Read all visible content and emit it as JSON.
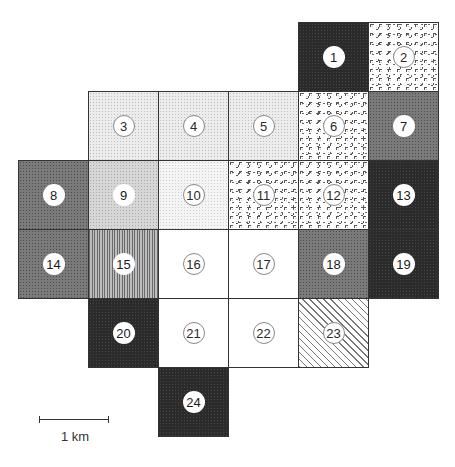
{
  "diagram": {
    "type": "grid-map",
    "grid": {
      "origin_px": [
        18,
        22
      ],
      "cell_width_px": 70,
      "cell_height_px": 69,
      "columns": 6,
      "rows": 6
    },
    "cells": [
      {
        "id": "1",
        "col": 4,
        "row": 0,
        "pattern": "black",
        "label_style": "solid"
      },
      {
        "id": "2",
        "col": 5,
        "row": 0,
        "pattern": "pebble",
        "label_style": "ring"
      },
      {
        "id": "3",
        "col": 1,
        "row": 1,
        "pattern": "light",
        "label_style": "ring"
      },
      {
        "id": "4",
        "col": 2,
        "row": 1,
        "pattern": "light",
        "label_style": "ring"
      },
      {
        "id": "5",
        "col": 3,
        "row": 1,
        "pattern": "light",
        "label_style": "ring"
      },
      {
        "id": "6",
        "col": 4,
        "row": 1,
        "pattern": "pebble",
        "label_style": "ring"
      },
      {
        "id": "7",
        "col": 5,
        "row": 1,
        "pattern": "mid",
        "label_style": "solid"
      },
      {
        "id": "8",
        "col": 0,
        "row": 2,
        "pattern": "mid",
        "label_style": "solid"
      },
      {
        "id": "9",
        "col": 1,
        "row": 2,
        "pattern": "light2",
        "label_style": "solid"
      },
      {
        "id": "10",
        "col": 2,
        "row": 2,
        "pattern": "verylight",
        "label_style": "ring"
      },
      {
        "id": "11",
        "col": 3,
        "row": 2,
        "pattern": "pebble",
        "label_style": "ring"
      },
      {
        "id": "12",
        "col": 4,
        "row": 2,
        "pattern": "pebble",
        "label_style": "ring"
      },
      {
        "id": "13",
        "col": 5,
        "row": 2,
        "pattern": "black",
        "label_style": "solid"
      },
      {
        "id": "14",
        "col": 0,
        "row": 3,
        "pattern": "mid",
        "label_style": "solid"
      },
      {
        "id": "15",
        "col": 1,
        "row": 3,
        "pattern": "vstripe",
        "label_style": "solid"
      },
      {
        "id": "16",
        "col": 2,
        "row": 3,
        "pattern": "white",
        "label_style": "ring"
      },
      {
        "id": "17",
        "col": 3,
        "row": 3,
        "pattern": "white",
        "label_style": "ring"
      },
      {
        "id": "18",
        "col": 4,
        "row": 3,
        "pattern": "mid",
        "label_style": "solid"
      },
      {
        "id": "19",
        "col": 5,
        "row": 3,
        "pattern": "black",
        "label_style": "solid"
      },
      {
        "id": "20",
        "col": 1,
        "row": 4,
        "pattern": "black",
        "label_style": "solid"
      },
      {
        "id": "21",
        "col": 2,
        "row": 4,
        "pattern": "white",
        "label_style": "ring"
      },
      {
        "id": "22",
        "col": 3,
        "row": 4,
        "pattern": "white",
        "label_style": "ring"
      },
      {
        "id": "23",
        "col": 4,
        "row": 4,
        "pattern": "diag",
        "label_style": "ring"
      },
      {
        "id": "24",
        "col": 2,
        "row": 5,
        "pattern": "black",
        "label_style": "solid"
      }
    ],
    "scale_bar": {
      "label": "1 km",
      "length_px": 70
    }
  }
}
